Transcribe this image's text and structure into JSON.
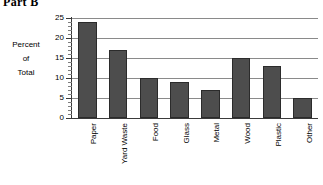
{
  "title": "Part B",
  "axis_label_lines": [
    "Percent",
    "of",
    "Total"
  ],
  "colors": {
    "bar_fill": "#4d4d4d",
    "bar_edge": "#2b2b2b",
    "gridline": "#8a8a8a",
    "axis": "#3a3a3a",
    "background": "#ffffff"
  },
  "chart_data": {
    "type": "bar",
    "title": "Part B",
    "xlabel": "",
    "ylabel": "Percent of Total",
    "ylim": [
      0,
      25
    ],
    "yticks": [
      0,
      5,
      10,
      15,
      20,
      25
    ],
    "ytick_labels": [
      "0",
      "5",
      "10",
      "15",
      "20",
      "25"
    ],
    "minor_tick_step": 1,
    "grid": true,
    "grid_axis": "y",
    "legend": false,
    "categories": [
      "Paper",
      "Yard Waste",
      "Food",
      "Glass",
      "Metal",
      "Wood",
      "Plastic",
      "Other"
    ],
    "values": [
      24,
      17,
      10,
      9,
      7,
      15,
      13,
      5
    ],
    "value_unit": "percent",
    "tick_label_rotation": -90
  }
}
